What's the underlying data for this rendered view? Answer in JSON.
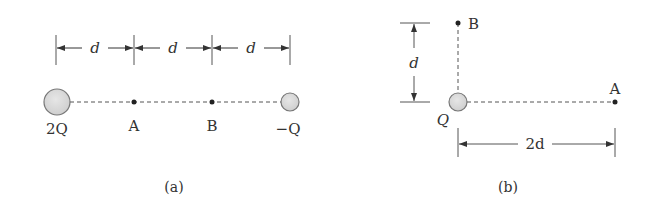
{
  "figure_a": {
    "caption": "(a)",
    "dimension_labels": [
      "d",
      "d",
      "d"
    ],
    "charges": [
      {
        "label": "2Q",
        "position": "left"
      },
      {
        "label": "−Q",
        "position": "right"
      }
    ],
    "points": [
      {
        "label": "A"
      },
      {
        "label": "B"
      }
    ]
  },
  "figure_b": {
    "caption": "(b)",
    "charge": {
      "label": "Q"
    },
    "points": [
      {
        "label": "B"
      },
      {
        "label": "A"
      }
    ],
    "vertical_dimension": "d",
    "horizontal_dimension": "2d"
  },
  "colors": {
    "charge_fill": "#d9d9d9",
    "charge_stroke": "#777777",
    "line": "#444444",
    "text": "#333333"
  }
}
